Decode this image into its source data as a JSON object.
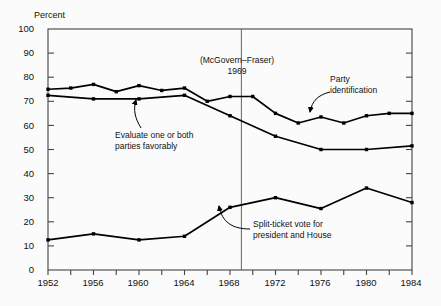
{
  "chart_data": {
    "type": "line",
    "title": "",
    "subtitle": "",
    "xlabel": "",
    "ylabel": "Percent",
    "xlim": [
      1952,
      1984
    ],
    "ylim": [
      0,
      100
    ],
    "grid": false,
    "legend_position": "inline-annotations",
    "x_tick_labels": [
      "1952",
      "1956",
      "1960",
      "1964",
      "1968",
      "1972",
      "1976",
      "1980",
      "1984"
    ],
    "x_tick_values": [
      1952,
      1956,
      1960,
      1964,
      1968,
      1972,
      1976,
      1980,
      1984
    ],
    "x_minor_tick_values": [
      1954,
      1958,
      1962,
      1966,
      1970,
      1974,
      1978,
      1982
    ],
    "y_tick_labels": [
      "0",
      "10",
      "20",
      "30",
      "40",
      "50",
      "60",
      "70",
      "80",
      "90",
      "100"
    ],
    "y_tick_values": [
      0,
      10,
      20,
      30,
      40,
      50,
      60,
      70,
      80,
      90,
      100
    ],
    "series": [
      {
        "name": "Party identification",
        "x": [
          1952,
          1954,
          1956,
          1958,
          1960,
          1962,
          1964,
          1966,
          1968,
          1970,
          1972,
          1974,
          1976,
          1978,
          1980,
          1982,
          1984
        ],
        "values": [
          75,
          75.5,
          77,
          74,
          76.5,
          74.5,
          75.5,
          70,
          72,
          72,
          65,
          61,
          63.5,
          61,
          64,
          65,
          65
        ]
      },
      {
        "name": "Evaluate one or both parties favorably",
        "x": [
          1952,
          1956,
          1960,
          1964,
          1968,
          1972,
          1976,
          1980,
          1984
        ],
        "values": [
          72.5,
          71,
          71,
          72.5,
          64,
          55.5,
          50,
          50,
          51.5
        ]
      },
      {
        "name": "Split-ticket vote for president and House",
        "x": [
          1952,
          1956,
          1960,
          1964,
          1968,
          1972,
          1976,
          1980,
          1984
        ],
        "values": [
          12.5,
          15,
          12.5,
          14,
          26,
          30,
          25.5,
          34,
          28
        ]
      }
    ],
    "annotations": [
      {
        "id": "mcgovern-fraser",
        "line1": "(McGovern–Fraser)",
        "line2": "1969",
        "marker_x": 1969,
        "marker_y_top": 100,
        "marker_y_bottom": 0
      },
      {
        "id": "party-identification",
        "line1": "Party",
        "line2": "identification",
        "points_to_x": 1974,
        "points_to_y": 61
      },
      {
        "id": "evaluate-parties",
        "line1": "Evaluate one or both",
        "line2": "parties favorably",
        "points_to_x": 1961,
        "points_to_y": 71
      },
      {
        "id": "split-ticket",
        "line1": "Split-ticket vote for",
        "line2": "president and House",
        "points_to_x": 1968,
        "points_to_y": 26
      }
    ],
    "colors": {
      "line": "#000000",
      "marker": "#000000",
      "axis": "#444444",
      "background": "#fbfbfb",
      "text": "#111111"
    }
  }
}
